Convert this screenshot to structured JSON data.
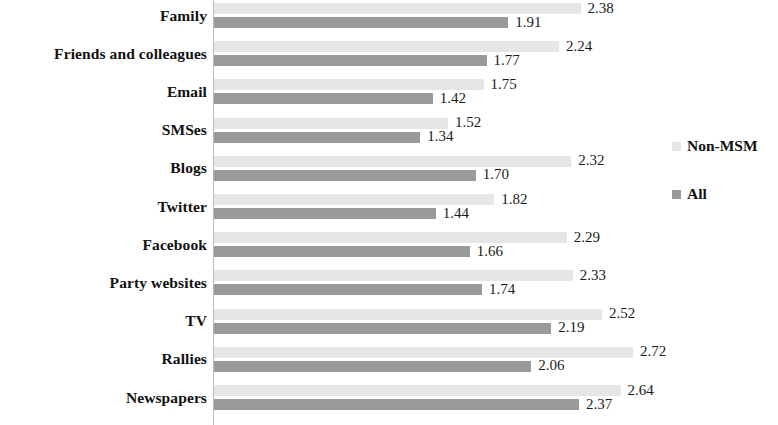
{
  "chart_data": {
    "type": "bar",
    "orientation": "horizontal",
    "title": "",
    "subtitle": "",
    "xlabel": "",
    "ylabel": "",
    "grid": false,
    "xlim": [
      0,
      2.9
    ],
    "axis_ticks_visible": false,
    "legend_position": "right",
    "categories": [
      "Family",
      "Friends and colleagues",
      "Email",
      "SMSes",
      "Blogs",
      "Twitter",
      "Facebook",
      "Party websites",
      "TV",
      "Rallies",
      "Newspapers"
    ],
    "series": [
      {
        "name": "Non-MSM",
        "color": "#e6e6e6",
        "values": [
          2.38,
          2.24,
          1.75,
          1.52,
          2.32,
          1.82,
          2.29,
          2.33,
          2.52,
          2.72,
          2.64
        ],
        "labels": [
          "2.38",
          "2.24",
          "1.75",
          "1.52",
          "2.32",
          "1.82",
          "2.29",
          "2.33",
          "2.52",
          "2.72",
          "2.64"
        ]
      },
      {
        "name": "All",
        "color": "#9a9a9a",
        "values": [
          1.91,
          1.77,
          1.42,
          1.34,
          1.7,
          1.44,
          1.66,
          1.74,
          2.19,
          2.06,
          2.37
        ],
        "labels": [
          "1.91",
          "1.77",
          "1.42",
          "1.34",
          "1.70",
          "1.44",
          "1.66",
          "1.74",
          "2.19",
          "2.06",
          "2.37"
        ]
      }
    ]
  },
  "legend": {
    "entries": [
      {
        "label": "Non-MSM",
        "swatch": "#e6e6e6"
      },
      {
        "label": "All",
        "swatch": "#9a9a9a"
      }
    ]
  }
}
